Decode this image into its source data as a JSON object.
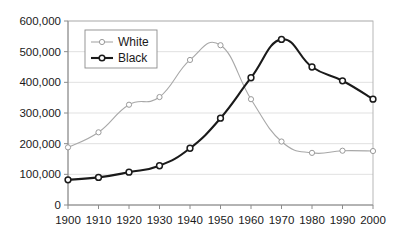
{
  "chart_data": {
    "type": "line",
    "title": "",
    "subtitle": "",
    "xlabel": "",
    "ylabel": "",
    "x": [
      1900,
      1910,
      1920,
      1930,
      1940,
      1950,
      1960,
      1970,
      1980,
      1990,
      2000
    ],
    "categories": [
      "1900",
      "1910",
      "1920",
      "1930",
      "1940",
      "1950",
      "1960",
      "1970",
      "1980",
      "1990",
      "2000"
    ],
    "xlim": [
      1900,
      2000
    ],
    "ylim": [
      0,
      600000
    ],
    "ytick_values": [
      0,
      100000,
      200000,
      300000,
      400000,
      500000,
      600000
    ],
    "ytick_labels": [
      "0",
      "100,000",
      "200,000",
      "300,000",
      "400,000",
      "500,000",
      "600,000"
    ],
    "grid": true,
    "legend_position": "top-left-inside",
    "series": [
      {
        "name": "White",
        "color": "#a8a8a8",
        "marker": "open-circle",
        "values": [
          188000,
          237000,
          327000,
          352000,
          473000,
          521000,
          345000,
          207000,
          170000,
          177000,
          176000
        ]
      },
      {
        "name": "Black",
        "color": "#1a1a1a",
        "marker": "open-circle",
        "values": [
          82000,
          90000,
          107000,
          128000,
          185000,
          283000,
          415000,
          540000,
          450000,
          405000,
          345000
        ]
      }
    ],
    "annotations": []
  },
  "legend": {
    "entries": [
      {
        "label": "White"
      },
      {
        "label": "Black"
      }
    ]
  },
  "colors": {
    "white_series": "#a8a8a8",
    "black_series": "#1a1a1a",
    "gridline": "#d9d9d9",
    "axis": "#8c8c8c",
    "background": "#ffffff",
    "text": "#1a1a1a"
  }
}
